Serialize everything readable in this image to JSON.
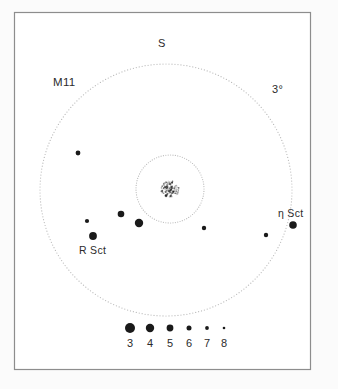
{
  "figure": {
    "kind": "star-finder-chart",
    "background_color": "#fbfbfb",
    "panel_color": "#ffffff",
    "frame_color": "#8d8d8d",
    "ink_color": "#1a1a1a",
    "dotted_color": "#b9b9b9"
  },
  "labels": {
    "cluster_name": "M11",
    "field_size": "3°",
    "direction_marker": "S",
    "star_eta_sct": "η Sct",
    "star_r_sct": "R Sct"
  },
  "legend": {
    "title": "magnitude-scale",
    "magnitudes": [
      "3",
      "4",
      "5",
      "6",
      "7",
      "8"
    ],
    "dot_radii": [
      5.0,
      4.2,
      3.4,
      2.5,
      1.9,
      1.3
    ],
    "dot_x": [
      130,
      150,
      170,
      189,
      207,
      224
    ],
    "dot_y": 328,
    "label_y": 337
  },
  "chart_data": {
    "type": "scatter",
    "title": "M11",
    "xlabel": "",
    "ylabel": "",
    "grid": false,
    "legend_position": "bottom",
    "field_of_view_degrees": 3,
    "field_circle": {
      "cx": 166,
      "cy": 190,
      "r": 126
    },
    "inner_circle": {
      "cx": 170,
      "cy": 189,
      "r": 34
    },
    "cluster_patch": {
      "cx": 170,
      "cy": 189,
      "label": "M11",
      "type": "open-cluster-glow"
    },
    "stars": [
      {
        "name": "",
        "x": 78,
        "y": 153,
        "mag": 6.0,
        "r": 2.4
      },
      {
        "name": "",
        "x": 121,
        "y": 214,
        "mag": 5.0,
        "r": 3.3
      },
      {
        "name": "",
        "x": 87,
        "y": 221,
        "mag": 6.5,
        "r": 2.1
      },
      {
        "name": "",
        "x": 139,
        "y": 223,
        "mag": 4.0,
        "r": 4.2
      },
      {
        "name": "R Sct",
        "x": 93,
        "y": 236,
        "mag": 4.5,
        "r": 3.9
      },
      {
        "name": "",
        "x": 204,
        "y": 228,
        "mag": 6.3,
        "r": 2.2
      },
      {
        "name": "",
        "x": 266,
        "y": 235,
        "mag": 6.3,
        "r": 2.2
      },
      {
        "name": "η Sct",
        "x": 293,
        "y": 225,
        "mag": 4.6,
        "r": 3.8
      }
    ]
  }
}
